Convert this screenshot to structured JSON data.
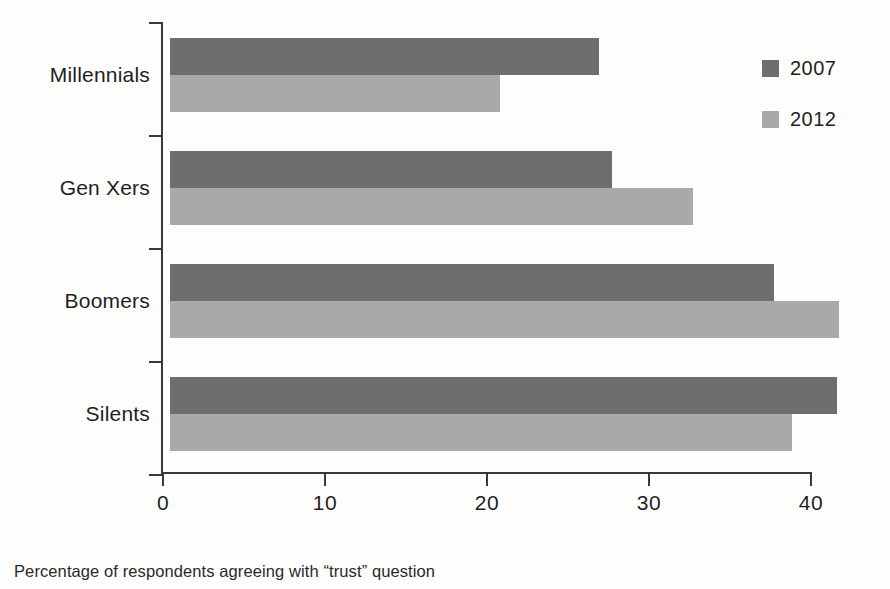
{
  "caption": "Percentage of respondents agreeing with “trust” question",
  "legend": {
    "position": "top-right",
    "entries": [
      {
        "label": "2007",
        "color": "#6e6e6e"
      },
      {
        "label": "2012",
        "color": "#a9a9a9"
      }
    ]
  },
  "colors": {
    "series_2007": "#6e6e6e",
    "series_2012": "#a9a9a9",
    "axis": "#3a3a3a",
    "text": "#1f1f1f",
    "background": "#fdfdfc"
  },
  "chart_data": {
    "type": "bar",
    "orientation": "horizontal",
    "title": "",
    "subtitle": "",
    "xlabel": "",
    "ylabel": "",
    "xlim": [
      0,
      41.5
    ],
    "ylim": [
      0,
      4
    ],
    "grid": false,
    "legend_position": "top-right",
    "annotation": "Percentage of respondents agreeing with “trust” question",
    "categories": [
      "Millennials",
      "Gen Xers",
      "Boomers",
      "Silents"
    ],
    "xticks": [
      0,
      10,
      20,
      30,
      40
    ],
    "xtick_labels": [
      "0",
      "10",
      "20",
      "30",
      "40"
    ],
    "series": [
      {
        "name": "2007",
        "color": "#6e6e6e",
        "values": [
          26.5,
          27.3,
          37.3,
          41.2
        ]
      },
      {
        "name": "2012",
        "color": "#a9a9a9",
        "values": [
          20.4,
          32.3,
          41.3,
          38.4
        ]
      }
    ]
  },
  "geometry": {
    "origin_x": 170,
    "axis_x": 161,
    "plot_top": 22,
    "baseline_y": 472,
    "px_per_unit": 16.2,
    "group_height": 113,
    "bar_height": 37,
    "group_gap": 39
  }
}
